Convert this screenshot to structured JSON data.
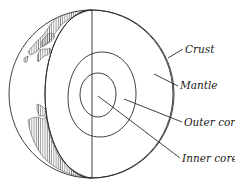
{
  "diagram": {
    "layers": [
      {
        "id": "crust",
        "label": "Crust",
        "fill": "#ffffff"
      },
      {
        "id": "mantle",
        "label": "Mantle",
        "fill": "#ffffff"
      },
      {
        "id": "outer_core",
        "label": "Outer core",
        "fill": "#ededed"
      },
      {
        "id": "inner_core",
        "label": "Inner core",
        "fill": "#c6c6c6"
      }
    ],
    "colors": {
      "line": "#2a2a2a",
      "land_hatch": "#555555",
      "background": "#ffffff"
    }
  }
}
